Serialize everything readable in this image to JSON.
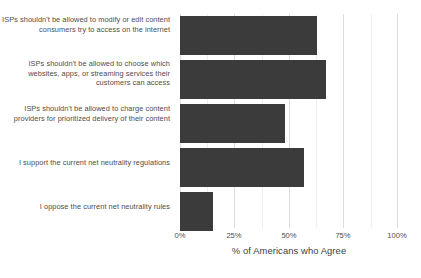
{
  "chart_data": {
    "type": "bar",
    "orientation": "horizontal",
    "title": "",
    "subtitle": "",
    "xlabel": "% of Americans who Agree",
    "ylabel": "",
    "xlim": [
      0,
      100
    ],
    "xticks": [
      0,
      25,
      50,
      75,
      100
    ],
    "xtick_labels": [
      "0%",
      "25%",
      "50%",
      "75%",
      "100%"
    ],
    "xminor_ticks": [
      12.5,
      37.5,
      62.5,
      87.5
    ],
    "grid": true,
    "grid_axis": "x",
    "legend": false,
    "legend_position": "none",
    "bar_color": "#3b3b3b",
    "background_color": "#ffffff",
    "categories": [
      "ISPs shouldn't be allowed to modify or edit content consumers try to access on the internet",
      "ISPs shouldn't be allowed to choose which websites, apps, or streaming services their customers can access",
      "ISPs shouldn't be allowed to charge content providers for prioritized delivery of their content",
      "I support the current net neutrality regulations",
      "I oppose the current net neutrality rules"
    ],
    "values": [
      63,
      67,
      48,
      57,
      15
    ]
  },
  "axis": {
    "title": "% of Americans who Agree"
  },
  "ticks": {
    "labels": [
      "0%",
      "25%",
      "50%",
      "75%",
      "100%"
    ]
  },
  "categories": {
    "labels": [
      "ISPs shouldn't be allowed to modify or edit content consumers try to access on the internet",
      "ISPs shouldn't be allowed to choose which websites, apps, or streaming services their customers can access",
      "ISPs shouldn't be allowed to charge content providers for prioritized delivery of their content",
      "I support the current net neutrality regulations",
      "I oppose the current net neutrality rules"
    ]
  },
  "colors": {
    "bar": "#3b3b3b",
    "gridline_major": "#dcdcdc",
    "gridline_minor": "#eeeeee",
    "text": "#4d4d4d",
    "background": "#ffffff"
  }
}
